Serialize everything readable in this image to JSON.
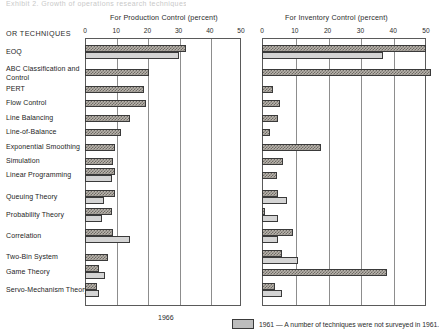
{
  "header": {
    "cropped_text": "Exhibit 2. Growth of operations research techniques"
  },
  "corner_label": "OR TECHNIQUES",
  "panels": [
    {
      "id": "production",
      "title": "For Production Control (percent)",
      "ticks": [
        "0",
        "10",
        "20",
        "30",
        "40",
        "50"
      ]
    },
    {
      "id": "inventory",
      "title": "For Inventory Control (percent)",
      "ticks": [
        "0",
        "10",
        "20",
        "30",
        "40",
        "50"
      ]
    }
  ],
  "footer": {
    "year_center": "1966",
    "legend_year": "1961",
    "legend_note": "1961 — A number of techniques were not surveyed in 1961."
  },
  "chart_data": {
    "type": "bar",
    "title": "Growth of operations research techniques",
    "orientation": "horizontal",
    "panel_layout": "two side-by-side panels sharing row categories",
    "xlabel": "percent",
    "ylabel": "OR TECHNIQUES",
    "xlim": [
      0,
      50
    ],
    "grid": true,
    "legend": [
      "1966",
      "1961"
    ],
    "legend_position": "bottom",
    "categories": [
      "EOQ",
      "ABC Classification and Control",
      "PERT",
      "Flow Control",
      "Line Balancing",
      "Line-of-Balance",
      "Exponential Smoothing",
      "Simulation",
      "Linear Programming",
      "Queuing Theory",
      "Probability Theory",
      "Correlation",
      "Two-Bin System",
      "Game Theory",
      "Servo-Mechanism Theory"
    ],
    "panels": [
      {
        "name": "For Production Control (percent)",
        "series": [
          {
            "name": "1966",
            "values": [
              32.5,
              20.5,
              19.0,
              19.5,
              14.5,
              11.5,
              9.5,
              9.0,
              9.5,
              9.5,
              8.5,
              9.0,
              7.5,
              4.5,
              4.0
            ]
          },
          {
            "name": "1961",
            "values": [
              30.0,
              null,
              null,
              null,
              null,
              null,
              null,
              null,
              8.5,
              6.0,
              5.5,
              14.5,
              null,
              6.5,
              4.5
            ]
          }
        ]
      },
      {
        "name": "For Inventory Control (percent)",
        "series": [
          {
            "name": "1966",
            "values": [
              50.0,
              51.5,
              3.5,
              5.5,
              5.0,
              2.5,
              18.0,
              6.5,
              4.5,
              5.0,
              1.0,
              9.5,
              6.0,
              38.0,
              4.0,
              3.5
            ]
          },
          {
            "name": "1961",
            "values": [
              37.0,
              null,
              null,
              null,
              null,
              null,
              null,
              null,
              null,
              null,
              7.5,
              5.0,
              11.0,
              null,
              6.0,
              5.0
            ]
          }
        ]
      }
    ],
    "rows": [
      {
        "label": "EOQ",
        "prod_1966": 32.5,
        "prod_1961": 30.0,
        "inv_1966": 50.0,
        "inv_1961": 37.0
      },
      {
        "label": "ABC Classification and Control",
        "prod_1966": 20.5,
        "prod_1961": null,
        "inv_1966": 51.5,
        "inv_1961": null
      },
      {
        "label": "PERT",
        "prod_1966": 19.0,
        "prod_1961": null,
        "inv_1966": 3.5,
        "inv_1961": null
      },
      {
        "label": "Flow Control",
        "prod_1966": 19.5,
        "prod_1961": null,
        "inv_1966": 5.5,
        "inv_1961": null
      },
      {
        "label": "Line Balancing",
        "prod_1966": 14.5,
        "prod_1961": null,
        "inv_1966": 5.0,
        "inv_1961": null
      },
      {
        "label": "Line-of-Balance",
        "prod_1966": 11.5,
        "prod_1961": null,
        "inv_1966": 2.5,
        "inv_1961": null
      },
      {
        "label": "Exponential Smoothing",
        "prod_1966": 9.5,
        "prod_1961": null,
        "inv_1966": 18.0,
        "inv_1961": null
      },
      {
        "label": "Simulation",
        "prod_1966": 9.0,
        "prod_1961": null,
        "inv_1966": 6.5,
        "inv_1961": null
      },
      {
        "label": "Linear Programming",
        "prod_1966": 9.5,
        "prod_1961": 8.5,
        "inv_1966": 4.5,
        "inv_1961": null
      },
      {
        "label": "Queuing Theory",
        "prod_1966": 9.5,
        "prod_1961": 6.0,
        "inv_1966": 5.0,
        "inv_1961": 7.5
      },
      {
        "label": "Probability Theory",
        "prod_1966": 8.5,
        "prod_1961": 5.5,
        "inv_1966": 1.0,
        "inv_1961": 5.0
      },
      {
        "label": "Correlation",
        "prod_1966": 9.0,
        "prod_1961": 14.5,
        "inv_1966": 9.5,
        "inv_1961": 5.0
      },
      {
        "label": "Two-Bin System",
        "prod_1966": 7.5,
        "prod_1961": null,
        "inv_1966": 6.0,
        "inv_1961": 11.0
      },
      {
        "label": "Game Theory",
        "prod_1966": 4.5,
        "prod_1961": 6.5,
        "inv_1966": 38.0,
        "inv_1961": null
      },
      {
        "label": "Servo-Mechanism Theory",
        "prod_1966": 4.0,
        "prod_1961": 4.5,
        "inv_1966": 4.0,
        "inv_1961": 6.0
      }
    ]
  }
}
